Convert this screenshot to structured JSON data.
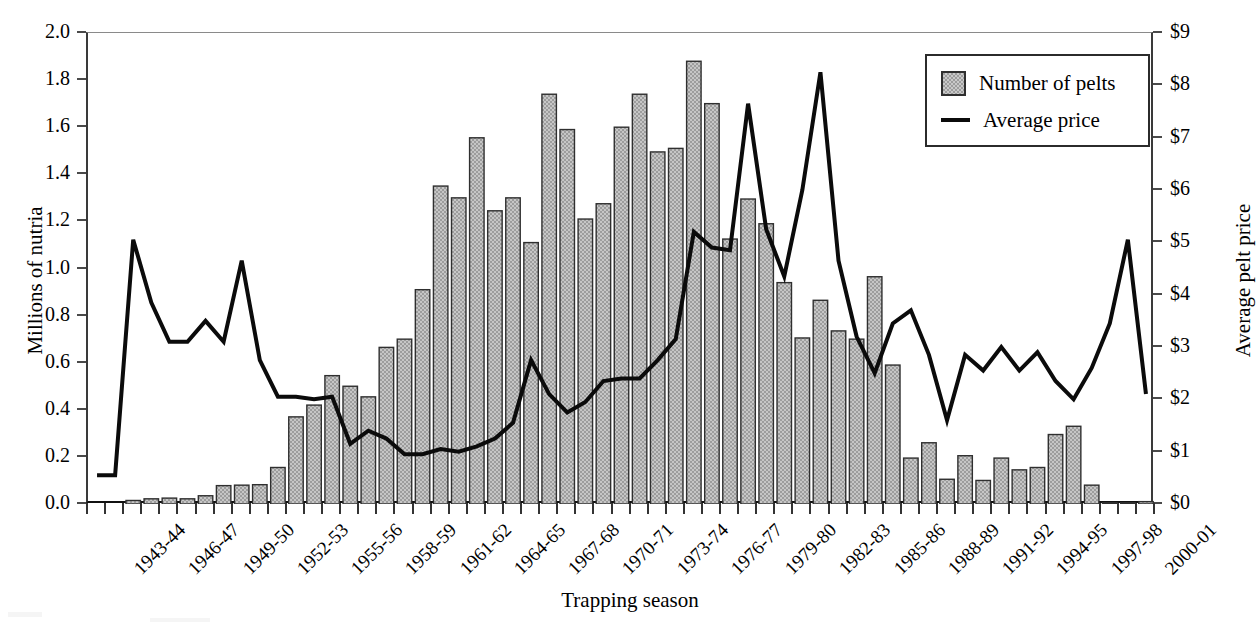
{
  "chart_data": {
    "type": "bar",
    "title": "",
    "xlabel": "Trapping season",
    "ylabel": "Millions of nutria",
    "ylabel_secondary": "Average pelt price",
    "ylim": [
      0.0,
      2.0
    ],
    "ylim_secondary": [
      0,
      9
    ],
    "grid": false,
    "legend_position": "top-right",
    "ytick_labels": [
      "0.0",
      "0.2",
      "0.4",
      "0.6",
      "0.8",
      "1.0",
      "1.2",
      "1.4",
      "1.6",
      "1.8",
      "2.0"
    ],
    "ytick_values": [
      0.0,
      0.2,
      0.4,
      0.6,
      0.8,
      1.0,
      1.2,
      1.4,
      1.6,
      1.8,
      2.0
    ],
    "ytick_labels_secondary": [
      "$0",
      "$1",
      "$2",
      "$3",
      "$4",
      "$5",
      "$6",
      "$7",
      "$8",
      "$9"
    ],
    "ytick_values_secondary": [
      0,
      1,
      2,
      3,
      4,
      5,
      6,
      7,
      8,
      9
    ],
    "categories": [
      "1942-43",
      "1943-44",
      "1944-45",
      "1945-46",
      "1946-47",
      "1947-48",
      "1948-49",
      "1949-50",
      "1950-51",
      "1951-52",
      "1952-53",
      "1953-54",
      "1954-55",
      "1955-56",
      "1956-57",
      "1957-58",
      "1958-59",
      "1959-60",
      "1960-61",
      "1961-62",
      "1962-63",
      "1963-64",
      "1964-65",
      "1965-66",
      "1966-67",
      "1967-68",
      "1968-69",
      "1969-70",
      "1970-71",
      "1971-72",
      "1972-73",
      "1973-74",
      "1974-75",
      "1975-76",
      "1976-77",
      "1977-78",
      "1978-79",
      "1979-80",
      "1980-81",
      "1981-82",
      "1982-83",
      "1983-84",
      "1984-85",
      "1985-86",
      "1986-87",
      "1987-88",
      "1988-89",
      "1989-90",
      "1990-91",
      "1991-92",
      "1992-93",
      "1993-94",
      "1994-95",
      "1995-96",
      "1996-97",
      "1997-98",
      "1998-99",
      "1999-00",
      "2000-01"
    ],
    "xtick_labels": [
      "1943-44",
      "1946-47",
      "1949-50",
      "1952-53",
      "1955-56",
      "1958-59",
      "1961-62",
      "1964-65",
      "1967-68",
      "1970-71",
      "1973-74",
      "1976-77",
      "1979-80",
      "1982-83",
      "1985-86",
      "1988-89",
      "1991-92",
      "1994-95",
      "1997-98",
      "2000-01"
    ],
    "xtick_indices": [
      1,
      4,
      7,
      10,
      13,
      16,
      19,
      22,
      25,
      28,
      31,
      34,
      37,
      40,
      43,
      46,
      49,
      52,
      55,
      58
    ],
    "series": [
      {
        "name": "Number of pelts",
        "kind": "bar",
        "axis": "left",
        "units": "millions of nutria",
        "color": "#9d9d9d",
        "edge_color": "#2f2f2f",
        "values": [
          0.0,
          0.0,
          0.015,
          0.022,
          0.025,
          0.022,
          0.035,
          0.078,
          0.08,
          0.082,
          0.155,
          0.37,
          0.42,
          0.545,
          0.5,
          0.455,
          0.665,
          0.7,
          0.91,
          1.35,
          1.3,
          1.555,
          1.245,
          1.3,
          1.11,
          1.74,
          1.59,
          1.21,
          1.275,
          1.6,
          1.74,
          1.495,
          1.51,
          1.88,
          1.7,
          1.125,
          1.295,
          1.19,
          0.94,
          0.705,
          0.865,
          0.735,
          0.7,
          0.965,
          0.59,
          0.195,
          0.26,
          0.105,
          0.205,
          0.1,
          0.195,
          0.145,
          0.155,
          0.295,
          0.33,
          0.08,
          0.005,
          0.005,
          0.01
        ]
      },
      {
        "name": "Average price",
        "kind": "line",
        "axis": "right",
        "units": "dollars per pelt",
        "color": "#0b0b0b",
        "values": [
          0.55,
          0.55,
          5.05,
          3.85,
          3.1,
          3.1,
          3.5,
          3.1,
          4.65,
          2.75,
          2.05,
          2.05,
          2.0,
          2.05,
          1.15,
          1.4,
          1.25,
          0.95,
          0.95,
          1.05,
          1.0,
          1.1,
          1.25,
          1.55,
          2.75,
          2.1,
          1.75,
          1.95,
          2.35,
          2.4,
          2.4,
          2.75,
          3.15,
          5.2,
          4.9,
          4.85,
          7.65,
          5.25,
          4.35,
          6.0,
          8.25,
          4.65,
          3.2,
          2.5,
          3.45,
          3.7,
          2.85,
          1.6,
          2.85,
          2.55,
          3.0,
          2.55,
          2.9,
          2.35,
          2.0,
          2.6,
          3.45,
          5.05,
          2.1
        ]
      }
    ],
    "annotations": []
  },
  "legend": {
    "items": [
      {
        "label": "Number of pelts",
        "marker": "swatch"
      },
      {
        "label": "Average price",
        "marker": "line"
      }
    ]
  },
  "axis_titles": {
    "left": "Millions of nutria",
    "right": "Average pelt price",
    "bottom": "Trapping season"
  }
}
